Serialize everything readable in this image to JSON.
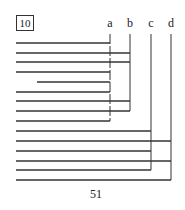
{
  "figure": {
    "box_label": "10",
    "page_number": "51",
    "columns": [
      {
        "label": "a",
        "x": 110,
        "y_end": 121
      },
      {
        "label": "b",
        "x": 130,
        "y_end": 111
      },
      {
        "label": "c",
        "x": 151,
        "y_end": 170
      },
      {
        "label": "d",
        "x": 171,
        "y_end": 180
      }
    ],
    "rows": [
      {
        "y": 43,
        "x_start": 16,
        "target": "a"
      },
      {
        "y": 53,
        "x_start": 16,
        "target": "b"
      },
      {
        "y": 62,
        "x_start": 16,
        "target": "b"
      },
      {
        "y": 72,
        "x_start": 16,
        "target": "a"
      },
      {
        "y": 82,
        "x_start": 37,
        "target": "a"
      },
      {
        "y": 92,
        "x_start": 16,
        "target": "a"
      },
      {
        "y": 101,
        "x_start": 16,
        "target": "b"
      },
      {
        "y": 111,
        "x_start": 16,
        "target": "b"
      },
      {
        "y": 121,
        "x_start": 16,
        "target": "a"
      },
      {
        "y": 131,
        "x_start": 16,
        "target": "c"
      },
      {
        "y": 141,
        "x_start": 16,
        "target": "d"
      },
      {
        "y": 151,
        "x_start": 16,
        "target": "c"
      },
      {
        "y": 161,
        "x_start": 16,
        "target": "d"
      },
      {
        "y": 170,
        "x_start": 16,
        "target": "c"
      },
      {
        "y": 180,
        "x_start": 16,
        "target": "d"
      }
    ],
    "line_color": "#333333"
  }
}
